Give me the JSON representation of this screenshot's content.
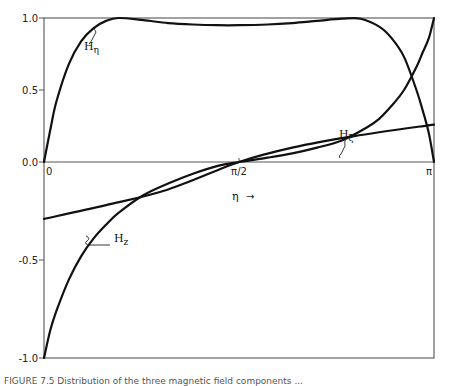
{
  "chart_data": {
    "type": "line",
    "title": "",
    "xlabel": "η",
    "xlabel_arrow": "→",
    "ylabel": "",
    "xlim": [
      0,
      3.14159
    ],
    "ylim": [
      -1.0,
      1.0
    ],
    "grid": false,
    "x_ticks": [
      {
        "value": 0,
        "label": "0"
      },
      {
        "value": 1.5708,
        "label": "π/2"
      },
      {
        "value": 3.14159,
        "label": "π"
      }
    ],
    "y_ticks": [
      {
        "value": 1.0,
        "label": "1.0"
      },
      {
        "value": 0.5,
        "label": "0.5"
      },
      {
        "value": 0.0,
        "label": "0.0"
      },
      {
        "value": -0.5,
        "label": "-0.5"
      },
      {
        "value": -1.0,
        "label": "-1.0"
      }
    ],
    "series": [
      {
        "name": "H_η",
        "label_main": "H",
        "label_sub": "η",
        "x": [
          0.0,
          0.05,
          0.1,
          0.2,
          0.3,
          0.4,
          0.5,
          0.6,
          0.8,
          1.0,
          1.2,
          1.4,
          1.5708,
          1.8,
          2.0,
          2.2,
          2.4,
          2.55,
          2.7,
          2.8,
          2.9,
          3.0,
          3.05,
          3.1,
          3.14159
        ],
        "y": [
          0.0,
          0.22,
          0.42,
          0.68,
          0.84,
          0.93,
          0.98,
          1.0,
          0.985,
          0.965,
          0.955,
          0.95,
          0.95,
          0.955,
          0.965,
          0.98,
          0.995,
          0.995,
          0.94,
          0.86,
          0.73,
          0.5,
          0.36,
          0.2,
          0.0
        ]
      },
      {
        "name": "H_ξ",
        "label_main": "H",
        "label_sub": "ξ",
        "x": [
          0.0,
          0.05,
          0.1,
          0.2,
          0.3,
          0.4,
          0.5,
          0.6,
          0.8,
          1.0,
          1.2,
          1.4,
          1.5708,
          1.8,
          2.0,
          2.2,
          2.4,
          2.6,
          2.7,
          2.8,
          2.9,
          3.0,
          3.05,
          3.1,
          3.14159
        ],
        "y": [
          -1.0,
          -0.86,
          -0.76,
          -0.6,
          -0.48,
          -0.39,
          -0.32,
          -0.26,
          -0.17,
          -0.11,
          -0.06,
          -0.02,
          0.0,
          0.03,
          0.06,
          0.1,
          0.15,
          0.24,
          0.3,
          0.39,
          0.5,
          0.66,
          0.76,
          0.86,
          1.0
        ]
      },
      {
        "name": "H_z",
        "label_main": "H",
        "label_sub": "z",
        "x": [
          0.0,
          0.5,
          1.0,
          1.5708,
          2.0,
          2.5,
          3.14159
        ],
        "y": [
          -0.29,
          -0.22,
          -0.14,
          0.0,
          0.1,
          0.18,
          0.26
        ]
      }
    ]
  },
  "caption": "FIGURE 7.5   Distribution of the three magnetic field components ..."
}
